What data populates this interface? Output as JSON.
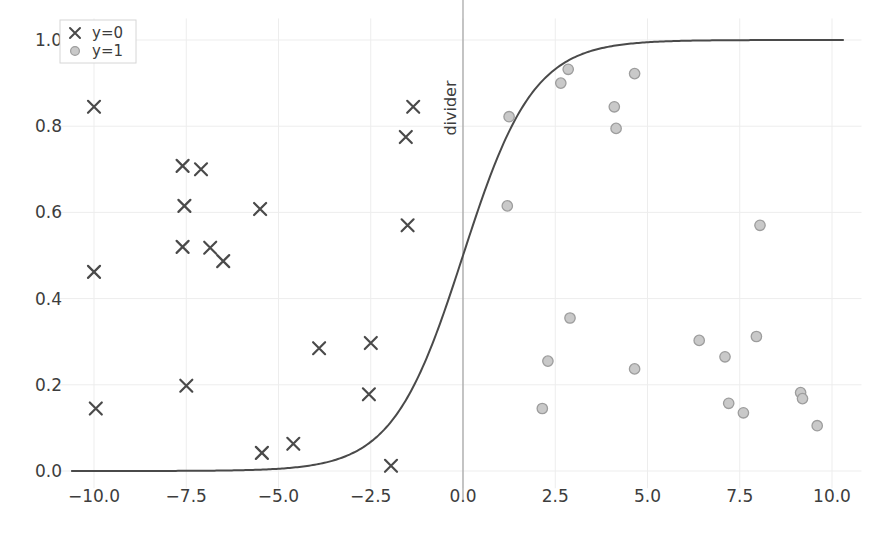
{
  "chart_data": {
    "type": "scatter",
    "title": "",
    "xlabel": "",
    "ylabel": "",
    "xlim": [
      -11.0,
      10.8
    ],
    "ylim": [
      -0.04,
      1.05
    ],
    "grid": true,
    "xticks": [
      -10.0,
      -7.5,
      -5.0,
      -2.5,
      0.0,
      2.5,
      5.0,
      7.5,
      10.0
    ],
    "xticklabels": [
      "−10.0",
      "−7.5",
      "−5.0",
      "−2.5",
      "0.0",
      "2.5",
      "5.0",
      "7.5",
      "10.0"
    ],
    "yticks": [
      0.0,
      0.2,
      0.4,
      0.6,
      0.8,
      1.0
    ],
    "yticklabels": [
      "0.0",
      "0.2",
      "0.4",
      "0.6",
      "0.8",
      "1.0"
    ],
    "legend": {
      "position": "upper left",
      "entries": [
        {
          "label": "y=0",
          "marker": "x",
          "color": "#4a4a4a"
        },
        {
          "label": "y=1",
          "marker": "o",
          "color": "#b5b5b5"
        }
      ]
    },
    "annotations": [
      {
        "text": "divider",
        "type": "vline",
        "x": 0.0,
        "rotation": 90,
        "color": "#9a9a9a"
      }
    ],
    "series": [
      {
        "name": "y=0",
        "marker": "x",
        "color": "#4a4a4a",
        "points": [
          [
            -10.0,
            0.845
          ],
          [
            -10.0,
            0.462
          ],
          [
            -9.95,
            0.145
          ],
          [
            -7.6,
            0.708
          ],
          [
            -7.1,
            0.7
          ],
          [
            -7.55,
            0.615
          ],
          [
            -7.6,
            0.52
          ],
          [
            -6.85,
            0.518
          ],
          [
            -6.5,
            0.487
          ],
          [
            -7.5,
            0.198
          ],
          [
            -5.5,
            0.608
          ],
          [
            -5.45,
            0.042
          ],
          [
            -4.6,
            0.063
          ],
          [
            -3.9,
            0.285
          ],
          [
            -2.5,
            0.297
          ],
          [
            -2.55,
            0.178
          ],
          [
            -1.95,
            0.012
          ],
          [
            -1.35,
            0.845
          ],
          [
            -1.55,
            0.775
          ],
          [
            -1.5,
            0.57
          ]
        ]
      },
      {
        "name": "y=1",
        "marker": "o",
        "color": "#b5b5b5",
        "points": [
          [
            1.25,
            0.822
          ],
          [
            1.2,
            0.615
          ],
          [
            2.15,
            0.145
          ],
          [
            2.3,
            0.255
          ],
          [
            2.65,
            0.9
          ],
          [
            2.85,
            0.932
          ],
          [
            2.9,
            0.355
          ],
          [
            4.1,
            0.845
          ],
          [
            4.15,
            0.795
          ],
          [
            4.65,
            0.922
          ],
          [
            4.65,
            0.237
          ],
          [
            6.4,
            0.303
          ],
          [
            7.1,
            0.265
          ],
          [
            7.2,
            0.157
          ],
          [
            7.6,
            0.135
          ],
          [
            7.95,
            0.312
          ],
          [
            8.05,
            0.57
          ],
          [
            9.15,
            0.182
          ],
          [
            9.2,
            0.168
          ],
          [
            9.6,
            0.105
          ]
        ]
      }
    ],
    "curve": {
      "name": "sigmoid",
      "type": "line",
      "color": "#4a4a4a",
      "function": "1/(1+exp(-k*x))",
      "k": 1.05,
      "x_range": [
        -10.6,
        10.3
      ]
    }
  }
}
